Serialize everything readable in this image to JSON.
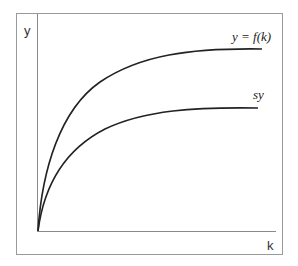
{
  "diagram": {
    "axes": {
      "y_label": "y",
      "x_label": "k"
    },
    "curves": [
      {
        "name": "production-function",
        "label": "y = f(k)",
        "color": "#222222"
      },
      {
        "name": "saving-function",
        "label": "sy",
        "color": "#222222"
      }
    ],
    "colors": {
      "frame": "#9a9a9a",
      "axis": "#8a8a8a",
      "curve": "#222222"
    }
  }
}
